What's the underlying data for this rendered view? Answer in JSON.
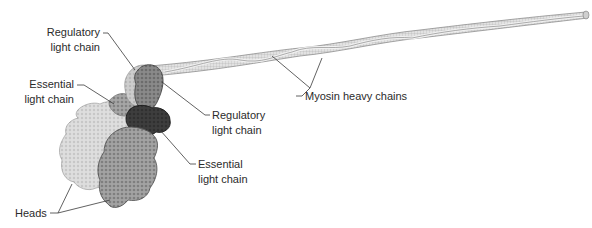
{
  "figure": {
    "labels": {
      "reg_lc_top": {
        "line1": "Regulatory",
        "line2": "light chain"
      },
      "ess_lc_left": {
        "line1": "Essential",
        "line2": "light chain"
      },
      "reg_lc_right": {
        "line1": "Regulatory",
        "line2": "light chain"
      },
      "ess_lc_right": {
        "line1": "Essential",
        "line2": "light chain"
      },
      "heavy_chains": {
        "text": "Myosin heavy chains"
      },
      "heads": {
        "text": "Heads"
      }
    },
    "colors": {
      "background": "#ffffff",
      "text": "#2b2b2b",
      "leader_line": "#3a3a3a",
      "coil_light": "#e6e6e6",
      "coil_mid": "#c4c4c4",
      "coil_dark": "#8e8e8e",
      "head_light": "#dcdcdc",
      "head_dark": "#9a9a9a",
      "reg_lc": "#7d7d7d",
      "ess_lc_dark": "#3c3c3c",
      "ess_lc_pale": "#b8b8b8"
    }
  }
}
